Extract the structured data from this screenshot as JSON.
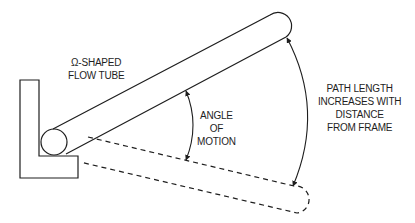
{
  "diagram": {
    "colors": {
      "stroke": "#1e1e1e",
      "background": "#ffffff"
    },
    "labels": {
      "flow_tube": [
        "Ω-SHAPED",
        "FLOW TUBE"
      ],
      "angle_of_motion": [
        "ANGLE",
        "OF",
        "MOTION"
      ],
      "path_length": [
        "PATH LENGTH",
        "INCREASES WITH",
        "DISTANCE",
        "FROM FRAME"
      ]
    },
    "elements": {
      "frame": "L-shaped frame",
      "tube": "flow tube (solid, upper position)",
      "tube_displaced": "flow tube (dashed, lower position)",
      "angle_arrow": "double-headed arc arrow",
      "path_arrow": "double-headed arc arrow"
    }
  }
}
